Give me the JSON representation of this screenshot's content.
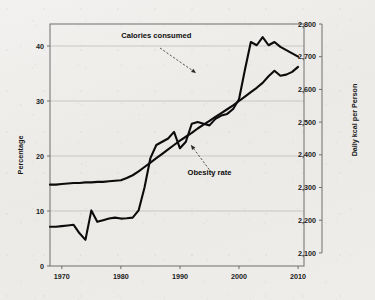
{
  "chart_data": {
    "type": "line",
    "title": "",
    "subtitle": "",
    "xlabel": "",
    "ylabel": "Percentage",
    "y2label": "Daily kcal per Person",
    "xlim": [
      1968,
      2011
    ],
    "ylim": [
      0,
      44
    ],
    "y2lim": [
      2060,
      2800
    ],
    "grid": true,
    "legend_position": "inline-annotations",
    "x_ticks": [
      1970,
      1980,
      1990,
      2000,
      2010
    ],
    "x_tick_labels": [
      "1970",
      "1980",
      "1990",
      "2000",
      "2010"
    ],
    "y_ticks": [
      0,
      10,
      20,
      30,
      40
    ],
    "y_tick_labels": [
      "0",
      "10",
      "20",
      "30",
      "40"
    ],
    "y2_ticks": [
      2100,
      2200,
      2300,
      2400,
      2500,
      2600,
      2700,
      2800
    ],
    "y2_tick_labels": [
      "2,100",
      "2,200",
      "2,300",
      "2,400",
      "2,500",
      "2,600",
      "2,700",
      "2,800"
    ],
    "annotations": [
      {
        "text": "Calories consumed",
        "x": 1986,
        "y": 41.5
      },
      {
        "text": "Obesity rate",
        "x": 1995,
        "y": 16.5
      }
    ],
    "series": [
      {
        "name": "Calories consumed",
        "axis": "right",
        "units": "kcal/day",
        "x": [
          1968,
          1969,
          1970,
          1971,
          1972,
          1973,
          1974,
          1975,
          1976,
          1977,
          1978,
          1979,
          1980,
          1981,
          1982,
          1983,
          1984,
          1985,
          1986,
          1987,
          1988,
          1989,
          1990,
          1991,
          1992,
          1993,
          1994,
          1995,
          1996,
          1997,
          1998,
          1999,
          2000,
          2001,
          2002,
          2003,
          2004,
          2005,
          2006,
          2007,
          2008,
          2009,
          2010
        ],
        "values": [
          2180,
          2180,
          2182,
          2184,
          2186,
          2160,
          2140,
          2230,
          2195,
          2200,
          2205,
          2208,
          2205,
          2206,
          2208,
          2230,
          2300,
          2390,
          2430,
          2440,
          2450,
          2470,
          2420,
          2440,
          2495,
          2500,
          2495,
          2490,
          2510,
          2520,
          2525,
          2540,
          2570,
          2660,
          2745,
          2735,
          2760,
          2735,
          2745,
          2730,
          2720,
          2710,
          2700
        ]
      },
      {
        "name": "Obesity rate",
        "axis": "left",
        "units": "percent",
        "x": [
          1968,
          1969,
          1970,
          1971,
          1972,
          1973,
          1974,
          1975,
          1976,
          1977,
          1978,
          1979,
          1980,
          1981,
          1982,
          1983,
          1984,
          1985,
          1986,
          1987,
          1988,
          1989,
          1990,
          1991,
          1992,
          1993,
          1994,
          1995,
          1996,
          1997,
          1998,
          1999,
          2000,
          2001,
          2002,
          2003,
          2004,
          2005,
          2006,
          2007,
          2008,
          2009,
          2010
        ],
        "values": [
          14.8,
          14.8,
          14.9,
          15.0,
          15.1,
          15.1,
          15.2,
          15.2,
          15.3,
          15.3,
          15.4,
          15.5,
          15.6,
          16.0,
          16.5,
          17.2,
          18.0,
          18.8,
          19.6,
          20.4,
          21.2,
          22.0,
          22.8,
          23.5,
          24.2,
          25.0,
          25.7,
          26.4,
          27.1,
          27.8,
          28.5,
          29.2,
          30.0,
          30.8,
          31.6,
          32.4,
          33.3,
          34.5,
          35.5,
          34.6,
          34.8,
          35.3,
          36.2
        ]
      }
    ]
  }
}
